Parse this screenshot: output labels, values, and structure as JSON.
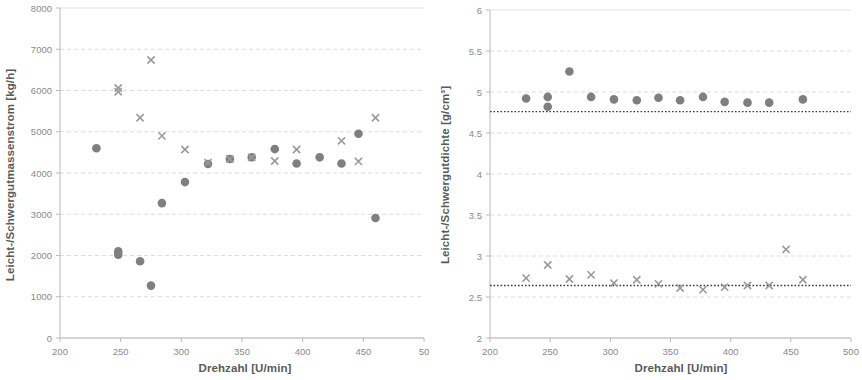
{
  "figure": {
    "background": "#ffffff",
    "marker_circle_color": "#7f7f7f",
    "marker_cross_color": "#9a9a9a",
    "gridline_color": "#e2e2e2",
    "refline_color": "#3a3a3a"
  },
  "chart_data": [
    {
      "type": "scatter",
      "title": "",
      "xlabel": "Drehzahl [U/min]",
      "ylabel": "Leicht-/Schwergutmassenstrom [kg/h]",
      "xlim": [
        200,
        500
      ],
      "ylim": [
        0,
        8000
      ],
      "xticks": [
        200,
        250,
        300,
        350,
        400,
        450,
        500
      ],
      "xtick_labels": [
        "200",
        "250",
        "300",
        "350",
        "400",
        "450",
        "50"
      ],
      "yticks": [
        0,
        1000,
        2000,
        3000,
        4000,
        5000,
        6000,
        7000,
        8000
      ],
      "ytick_labels": [
        "0",
        "1000",
        "2000",
        "3000",
        "4000",
        "5000",
        "6000",
        "7000",
        "8000"
      ],
      "grid": true,
      "legend": "none",
      "series": [
        {
          "name": "Schwergutmassenstrom",
          "marker": "circle",
          "points": [
            [
              230,
              4600
            ],
            [
              248,
              2100
            ],
            [
              248,
              2020
            ],
            [
              266,
              1860
            ],
            [
              275,
              1270
            ],
            [
              284,
              3270
            ],
            [
              303,
              3780
            ],
            [
              322,
              4220
            ],
            [
              340,
              4340
            ],
            [
              358,
              4380
            ],
            [
              377,
              4580
            ],
            [
              395,
              4230
            ],
            [
              414,
              4380
            ],
            [
              432,
              4230
            ],
            [
              446,
              4950
            ],
            [
              460,
              2910
            ]
          ]
        },
        {
          "name": "Leichtgutmassenstrom",
          "marker": "cross",
          "points": [
            [
              248,
              6060
            ],
            [
              248,
              5970
            ],
            [
              266,
              5340
            ],
            [
              275,
              6740
            ],
            [
              284,
              4900
            ],
            [
              303,
              4570
            ],
            [
              322,
              4250
            ],
            [
              340,
              4340
            ],
            [
              358,
              4380
            ],
            [
              377,
              4290
            ],
            [
              395,
              4570
            ],
            [
              432,
              4780
            ],
            [
              446,
              4280
            ],
            [
              460,
              5340
            ]
          ]
        }
      ]
    },
    {
      "type": "scatter",
      "title": "",
      "xlabel": "Drehzahl [U/min]",
      "ylabel": "Leicht-/Schwergutdichte [g/cm³]",
      "xlim": [
        200,
        500
      ],
      "ylim": [
        2,
        6
      ],
      "xticks": [
        200,
        250,
        300,
        350,
        400,
        450,
        500
      ],
      "xtick_labels": [
        "200",
        "250",
        "300",
        "350",
        "400",
        "450",
        "500"
      ],
      "yticks": [
        2,
        2.5,
        3,
        3.5,
        4,
        4.5,
        5,
        5.5,
        6
      ],
      "ytick_labels": [
        "2",
        "2.5",
        "3",
        "3.5",
        "4",
        "4.5",
        "5",
        "5.5",
        "6"
      ],
      "grid": true,
      "legend": "none",
      "reference_lines": [
        {
          "name": "Schwergutdichte-Referenz",
          "y": 4.76
        },
        {
          "name": "Leichtgutdichte-Referenz",
          "y": 2.64
        }
      ],
      "series": [
        {
          "name": "Schwergutdichte",
          "marker": "circle",
          "points": [
            [
              230,
              4.92
            ],
            [
              248,
              4.94
            ],
            [
              248,
              4.82
            ],
            [
              266,
              5.25
            ],
            [
              284,
              4.94
            ],
            [
              303,
              4.91
            ],
            [
              322,
              4.9
            ],
            [
              340,
              4.93
            ],
            [
              358,
              4.9
            ],
            [
              377,
              4.94
            ],
            [
              395,
              4.88
            ],
            [
              414,
              4.87
            ],
            [
              432,
              4.87
            ],
            [
              460,
              4.91
            ]
          ]
        },
        {
          "name": "Leichtgutdichte",
          "marker": "cross",
          "points": [
            [
              230,
              2.73
            ],
            [
              248,
              2.89
            ],
            [
              266,
              2.72
            ],
            [
              284,
              2.77
            ],
            [
              303,
              2.67
            ],
            [
              322,
              2.71
            ],
            [
              340,
              2.66
            ],
            [
              358,
              2.61
            ],
            [
              377,
              2.59
            ],
            [
              395,
              2.62
            ],
            [
              414,
              2.64
            ],
            [
              432,
              2.64
            ],
            [
              446,
              3.08
            ],
            [
              460,
              2.71
            ]
          ]
        }
      ]
    }
  ]
}
